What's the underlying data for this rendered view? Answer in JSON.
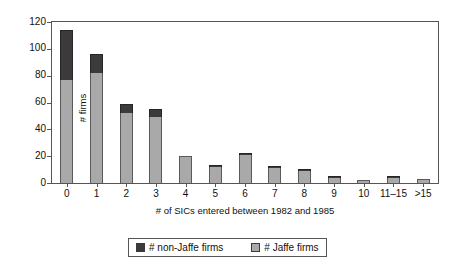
{
  "chart_data": {
    "type": "bar",
    "subtype": "stacked-vertical",
    "title": "",
    "xlabel": "# of SICs entered between 1982 and 1985",
    "ylabel": "# firms",
    "ylim": [
      0,
      120
    ],
    "y_ticks": [
      0,
      20,
      40,
      60,
      80,
      100,
      120
    ],
    "grid": false,
    "legend_position": "bottom",
    "categories": [
      "0",
      "1",
      "2",
      "3",
      "4",
      "5",
      "6",
      "7",
      "8",
      "9",
      "10",
      "11–15",
      ">15"
    ],
    "series": [
      {
        "name": "# Jaffe firms",
        "color": "#a9a9a9",
        "values": [
          77,
          82,
          52,
          49,
          20,
          12,
          21,
          11,
          9,
          4,
          2,
          4,
          3
        ]
      },
      {
        "name": "# non-Jaffe firms",
        "color": "#3c3a3a",
        "values": [
          37,
          14,
          7,
          6,
          0,
          1,
          1,
          1,
          1,
          1,
          0,
          1,
          0
        ]
      }
    ],
    "totals": [
      114,
      96,
      59,
      55,
      20,
      13,
      22,
      12,
      10,
      5,
      2,
      5,
      3
    ]
  },
  "axes": {
    "y": {
      "label": "# firms",
      "ticks": [
        "0",
        "20",
        "40",
        "60",
        "80",
        "100",
        "120"
      ]
    },
    "x": {
      "label": "# of SICs entered between 1982 and 1985",
      "ticks": [
        "0",
        "1",
        "2",
        "3",
        "4",
        "5",
        "6",
        "7",
        "8",
        "9",
        "10",
        "11–15",
        ">15"
      ]
    }
  },
  "legend": {
    "entries": [
      {
        "label": "# non-Jaffe firms",
        "color": "#3c3a3a"
      },
      {
        "label": "# Jaffe firms",
        "color": "#a9a9a9"
      }
    ]
  }
}
